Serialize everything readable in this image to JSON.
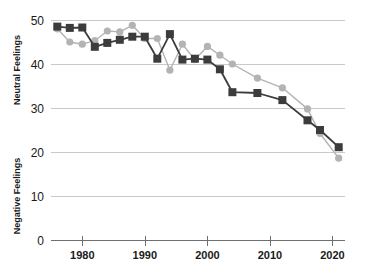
{
  "chart_data": {
    "type": "line",
    "title": "",
    "xlabel": "",
    "ylabel_upper": "Neutral Feelings",
    "ylabel_lower": "Negative Feelings",
    "xlim": [
      1975,
      2022
    ],
    "ylim": [
      0,
      50
    ],
    "yticks": [
      0,
      10,
      20,
      30,
      40,
      50
    ],
    "ytick_labels": [
      "0",
      "10",
      "20",
      "30",
      "40",
      "50"
    ],
    "xticks": [
      1980,
      1990,
      2000,
      2010,
      2020
    ],
    "xtick_labels": [
      "1980",
      "1990",
      "2000",
      "2010",
      "2020"
    ],
    "grid": true,
    "legend": "none",
    "series": [
      {
        "name": "dark-series",
        "color": "#3c3c3c",
        "marker": "square",
        "x": [
          1976,
          1978,
          1980,
          1982,
          1984,
          1986,
          1988,
          1990,
          1992,
          1994,
          1996,
          1998,
          2000,
          2002,
          2004,
          2008,
          2012,
          2016,
          2018,
          2021
        ],
        "values": [
          48.5,
          48.2,
          48.3,
          43.9,
          44.8,
          45.5,
          46.2,
          46.2,
          41.2,
          46.8,
          41.0,
          41.2,
          41.0,
          38.8,
          33.6,
          33.4,
          31.8,
          27.2,
          25.0,
          21.1
        ]
      },
      {
        "name": "light-series",
        "color": "#b3b3b3",
        "marker": "circle",
        "x": [
          1976,
          1978,
          1980,
          1982,
          1984,
          1986,
          1988,
          1990,
          1992,
          1994,
          1996,
          1998,
          2000,
          2002,
          2004,
          2008,
          2012,
          2016,
          2018,
          2021
        ],
        "values": [
          48.0,
          45.0,
          44.5,
          45.3,
          47.5,
          47.3,
          48.8,
          45.8,
          45.8,
          38.6,
          44.5,
          41.0,
          44.0,
          42.0,
          40.0,
          36.8,
          34.6,
          29.8,
          24.2,
          18.6
        ]
      }
    ]
  },
  "style": {
    "grid_color": "#c9c9c9",
    "axis_color": "#6f6f6f",
    "background": "#ffffff",
    "dark_series_color": "#3c3c3c",
    "light_series_color": "#b3b3b3"
  }
}
